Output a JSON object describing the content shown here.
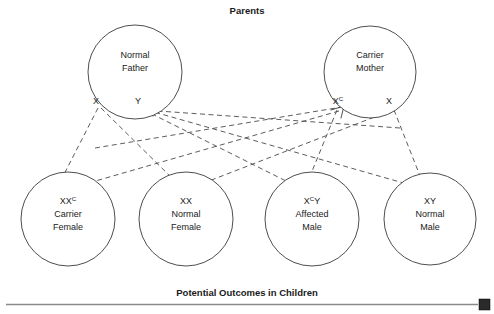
{
  "figure": {
    "top_heading": "Parents",
    "bottom_heading": "Potential Outcomes in Children",
    "line_color": "#4a4a4a",
    "circle_stroke": "#3a3a3a",
    "text_color": "#1a1a1a",
    "background": "#ffffff"
  },
  "parents": [
    {
      "id": "normal-father",
      "title_line1": "Normal",
      "title_line2": "Father",
      "cx": 135,
      "cy": 72,
      "r": 47,
      "alleles": [
        {
          "id": "father-allele-x",
          "base": "X",
          "sup": "",
          "x": 96,
          "y": 104
        },
        {
          "id": "father-allele-y",
          "base": "Y",
          "sup": "",
          "x": 138,
          "y": 104
        }
      ]
    },
    {
      "id": "carrier-mother",
      "title_line1": "Carrier",
      "title_line2": "Mother",
      "cx": 370,
      "cy": 72,
      "r": 46,
      "alleles": [
        {
          "id": "mother-allele-xc",
          "base": "X",
          "sup": "C",
          "x": 341,
          "y": 104
        },
        {
          "id": "mother-allele-x",
          "base": "X",
          "sup": "",
          "x": 389,
          "y": 104
        }
      ]
    }
  ],
  "children": [
    {
      "id": "carrier-female",
      "genotype_base": "XX",
      "genotype_sup": "C",
      "desc_line1": "Carrier",
      "desc_line2": "Female",
      "cx": 68,
      "cy": 219,
      "r": 47
    },
    {
      "id": "normal-female",
      "genotype_base": "XX",
      "genotype_sup": "",
      "desc_line1": "Normal",
      "desc_line2": "Female",
      "cx": 186,
      "cy": 219,
      "r": 47
    },
    {
      "id": "affected-male",
      "genotype_base": "X",
      "genotype_sup": "C",
      "genotype_tail": "Y",
      "desc_line1": "Affected",
      "desc_line2": "Male",
      "cx": 312,
      "cy": 219,
      "r": 47
    },
    {
      "id": "normal-male",
      "genotype_base": "XY",
      "genotype_sup": "",
      "desc_line1": "Normal",
      "desc_line2": "Male",
      "cx": 430,
      "cy": 219,
      "r": 46
    }
  ],
  "links": [
    {
      "id": "link-father-x-to-carrier-female",
      "from": "father-allele-x",
      "to": "carrier-female",
      "d": "M 98 108 L 58 186"
    },
    {
      "id": "link-father-x-to-normal-female",
      "from": "father-allele-x",
      "to": "normal-female",
      "d": "M 101 108 L 180 186"
    },
    {
      "id": "link-mother-xc-to-carrier-female",
      "from": "mother-allele-xc",
      "to": "carrier-female",
      "d": "M 340 110 L 78 186"
    },
    {
      "id": "link-mother-x-to-normal-female",
      "from": "mother-allele-x",
      "to": "normal-female",
      "d": "M 391 110 L 196 186"
    },
    {
      "id": "link-mother-xc-to-affected-male",
      "from": "mother-allele-xc",
      "to": "affected-male",
      "d": "M 337 110 L 306 186"
    },
    {
      "id": "link-mother-x-to-normal-male",
      "from": "mother-allele-x",
      "to": "normal-male",
      "d": "M 394 110 L 424 186"
    },
    {
      "id": "link-father-y-to-affected-male",
      "from": "father-allele-y",
      "to": "affected-male",
      "d": "M 144 110 L 296 186"
    },
    {
      "id": "link-father-y-to-normal-male",
      "from": "father-allele-y",
      "to": "normal-male",
      "d": "M 147 110 L 414 186"
    },
    {
      "id": "link-cross-to-father-y",
      "from": "mother-side",
      "to": "father-allele-y",
      "d": "M 372 116 L 143 111"
    },
    {
      "id": "link-cross-to-mother-xc",
      "from": "father-side",
      "to": "mother-allele-xc",
      "d": "M 135 120 L 342 107"
    }
  ],
  "footer": {
    "rule_color": "#8a8a8a",
    "corner_square_color": "#2a2a2a"
  }
}
